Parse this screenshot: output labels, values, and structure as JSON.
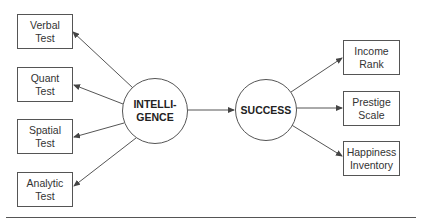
{
  "diagram": {
    "latent_left": {
      "line1": "INTELLI-",
      "line2": "GENCE"
    },
    "latent_right": {
      "line1": "SUCCESS"
    },
    "left_indicators": [
      {
        "line1": "Verbal",
        "line2": "Test"
      },
      {
        "line1": "Quant",
        "line2": "Test"
      },
      {
        "line1": "Spatial",
        "line2": "Test"
      },
      {
        "line1": "Analytic",
        "line2": "Test"
      }
    ],
    "right_indicators": [
      {
        "line1": "Income",
        "line2": "Rank"
      },
      {
        "line1": "Prestige",
        "line2": "Scale"
      },
      {
        "line1": "Happiness",
        "line2": "Inventory"
      }
    ],
    "colors": {
      "stroke": "#555555",
      "text": "#333333"
    }
  }
}
